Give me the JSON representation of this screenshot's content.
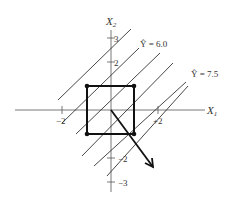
{
  "axes": {
    "x_label": "X",
    "x_sub": "1",
    "y_label": "X",
    "y_sub": "2"
  },
  "ticks": {
    "x_neg2": "−2",
    "x_pos2": "+2",
    "y_pos2": "2",
    "y_pos3": "3",
    "y_neg2": "−2",
    "y_neg3": "−3"
  },
  "contours": {
    "label_a": "Ŷ = 6.0",
    "label_b": "Ŷ = 7.5"
  },
  "colors": {
    "ink": "#222222",
    "background": "#ffffff"
  }
}
